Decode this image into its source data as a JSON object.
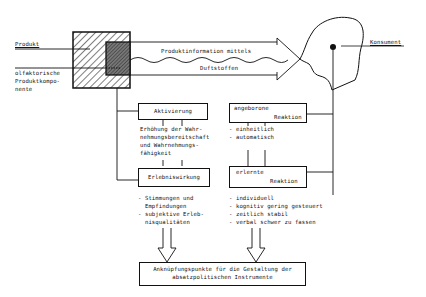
{
  "diagram": {
    "left_labels": {
      "product": "Produkt",
      "olfactory_component": [
        "olfaktorische",
        "Produktkompo-",
        "nente"
      ]
    },
    "right_label": "Konsument",
    "arrows": {
      "top_text": "Produktinformation mittels",
      "bottom_text": "Duftstoffen"
    },
    "boxes": {
      "activation": "Aktivierung",
      "experience_effect": "Erlebniswirkung",
      "innate_reaction": {
        "line1": "angeborone",
        "line2": "Reaktion"
      },
      "learned_reaction": {
        "line1": "erlernte",
        "line2": "Reaktion"
      },
      "bottom": {
        "line1": "Anknüpfungspunkte für die Gestaltung der",
        "line2": "absatzpolitischen Instrumente"
      }
    },
    "descriptions": {
      "activation": [
        "Erhöhung der Wahr-",
        "nehmungsbereitschaft",
        "und Wahrnehmungs-",
        "fähigkeit"
      ],
      "innate": [
        "- einheitlich",
        "- automatisch"
      ],
      "experience": [
        "- Stimmungen und",
        "  Empfindungen",
        "- subjektive Erleb-",
        "  nisqualitäten"
      ],
      "learned": [
        "- individuell",
        "- kognitiv gering gesteuert",
        "- zeitlich stabil",
        "- verbal schwer zu fassen"
      ]
    },
    "colors": {
      "ink": "#111111",
      "background": "#ffffff"
    }
  }
}
